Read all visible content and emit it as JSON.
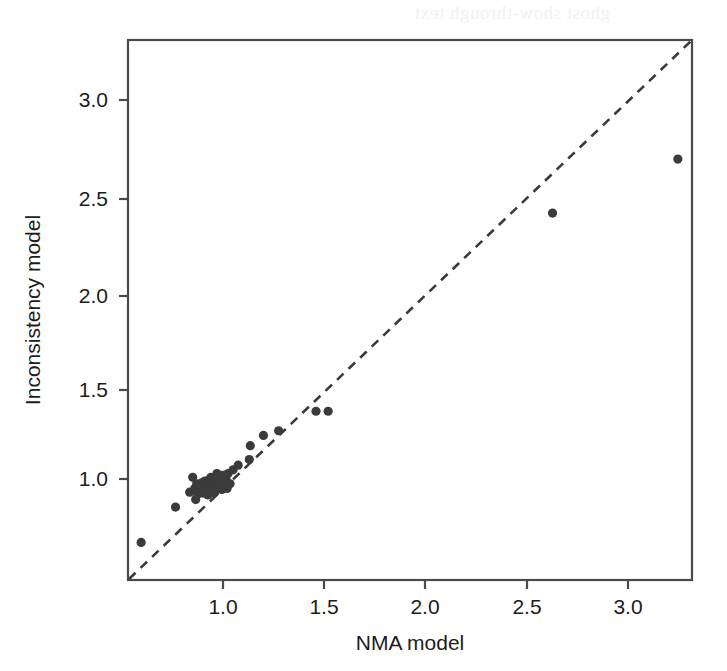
{
  "figure": {
    "ghost_text": "ghost show-through text",
    "background_color": "#ffffff",
    "point_color": "#3b3b3b",
    "line_color": "#3a3a3a",
    "frame_color": "#4a4a4a"
  },
  "chart_data": {
    "type": "scatter",
    "title": "",
    "subtitle": "",
    "xlabel": "NMA model",
    "ylabel": "Inconsistency model",
    "xlim": [
      0.555,
      3.345
    ],
    "ylim": [
      0.468,
      3.37
    ],
    "xticks": [
      1.0,
      1.5,
      2.0,
      2.5,
      3.0
    ],
    "xtick_labels": [
      "1.0",
      "1.5",
      "2.0",
      "2.5",
      "3.0"
    ],
    "yticks": [
      1.0,
      1.5,
      2.0,
      2.5,
      3.0
    ],
    "ytick_labels": [
      "1.0",
      "1.5",
      "2.0",
      "2.5",
      "3.0"
    ],
    "grid": false,
    "legend": null,
    "legend_position": "none",
    "reference_line": {
      "name": "identity-line",
      "style": "dashed",
      "slope": 1,
      "intercept": 0,
      "description": "line of equality y = x drawn corner to corner"
    },
    "point_marker": "filled-circle",
    "point_radius_px": 4.6,
    "n_points": 56,
    "series": [
      {
        "name": "Heterogeneity variance comparison",
        "points": [
          [
            0.62,
            0.67
          ],
          [
            0.79,
            0.86
          ],
          [
            0.86,
            0.94
          ],
          [
            0.875,
            1.02
          ],
          [
            0.885,
            0.96
          ],
          [
            0.89,
            0.9
          ],
          [
            0.895,
            0.985
          ],
          [
            0.9,
            0.93
          ],
          [
            0.905,
            0.955
          ],
          [
            0.91,
            0.975
          ],
          [
            0.915,
            0.945
          ],
          [
            0.92,
            0.99
          ],
          [
            0.925,
            0.935
          ],
          [
            0.93,
            0.965
          ],
          [
            0.935,
            1.0
          ],
          [
            0.94,
            0.955
          ],
          [
            0.945,
            0.985
          ],
          [
            0.95,
            0.925
          ],
          [
            0.95,
            0.97
          ],
          [
            0.955,
            1.005
          ],
          [
            0.955,
            0.945
          ],
          [
            0.96,
            0.99
          ],
          [
            0.96,
            0.96
          ],
          [
            0.965,
            1.02
          ],
          [
            0.965,
            0.935
          ],
          [
            0.97,
            0.975
          ],
          [
            0.97,
            1.0
          ],
          [
            0.975,
            0.95
          ],
          [
            0.975,
            1.01
          ],
          [
            0.98,
            0.985
          ],
          [
            0.98,
            0.965
          ],
          [
            0.985,
            1.0
          ],
          [
            0.985,
            0.94
          ],
          [
            0.99,
            1.015
          ],
          [
            0.99,
            0.975
          ],
          [
            0.995,
            0.99
          ],
          [
            0.995,
            1.04
          ],
          [
            1.0,
            0.96
          ],
          [
            1.0,
            1.0
          ],
          [
            1.005,
            1.02
          ],
          [
            1.01,
            0.985
          ],
          [
            1.015,
            1.005
          ],
          [
            1.02,
            0.955
          ],
          [
            1.025,
            1.03
          ],
          [
            1.03,
            0.99
          ],
          [
            1.04,
            1.01
          ],
          [
            1.045,
            0.96
          ],
          [
            1.05,
            1.04
          ],
          [
            1.06,
            0.985
          ],
          [
            1.075,
            1.06
          ],
          [
            1.1,
            1.085
          ],
          [
            1.155,
            1.115
          ],
          [
            1.16,
            1.19
          ],
          [
            1.225,
            1.245
          ],
          [
            1.3,
            1.27
          ],
          [
            1.485,
            1.375
          ],
          [
            1.545,
            1.375
          ],
          [
            2.655,
            2.44
          ],
          [
            3.275,
            2.73
          ]
        ]
      }
    ]
  }
}
